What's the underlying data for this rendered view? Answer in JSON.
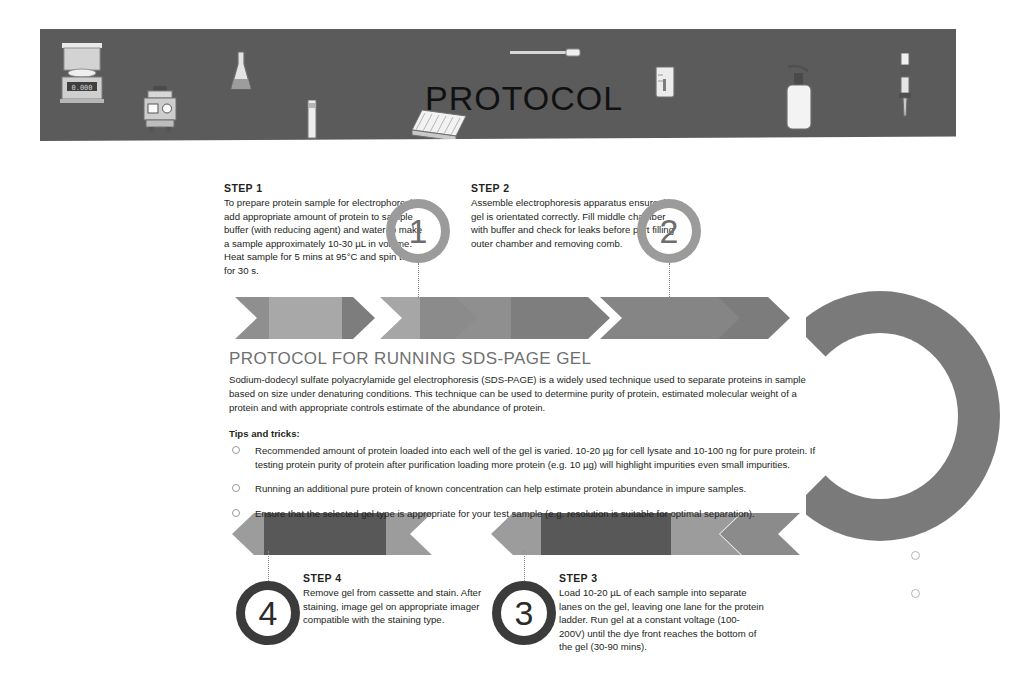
{
  "document": {
    "banner_title": "PROTOCOL",
    "banner_icons": [
      "analytical-balance-icon",
      "erlenmeyer-flask-icon",
      "vortex-mixer-icon",
      "cuvette-icon",
      "microplate-icon",
      "pipette-tip-icon",
      "beaker-icon",
      "wash-bottle-icon",
      "single-channel-pipette-icon",
      "multichannel-pipette-icon"
    ]
  },
  "main": {
    "title": "PROTOCOL FOR RUNNING SDS-PAGE GEL",
    "description": "Sodium-dodecyl sulfate polyacrylamide gel electrophoresis (SDS-PAGE) is a widely used technique used to separate proteins in sample based on size under denaturing conditions. This technique can be used to determine purity of protein, estimated molecular weight of a protein and with appropriate controls estimate of the abundance of protein.",
    "tips_title": "Tips and tricks:",
    "tips": [
      "Recommended amount of protein loaded into each well of the gel is varied. 10-20 µg for cell lysate and 10-100 ng for pure protein. If testing protein purity of protein after purification loading more protein (e.g. 10 µg) will highlight impurities even small impurities.",
      "Running an additional pure protein of known concentration can help estimate protein abundance in impure samples.",
      "Ensure that the selected gel type is appropriate for your test sample (e.g. resolution is suitable for optimal separation)."
    ]
  },
  "steps": [
    {
      "id": "step-1",
      "title": "STEP 1",
      "number": "1",
      "body": "To prepare protein sample for electrophoresis add appropriate amount of protein to sample buffer (with reducing agent) and water to make a sample approximately 10-30 µL in volume. Heat sample for 5 mins at 95°C and spin tube for 30 s."
    },
    {
      "id": "step-2",
      "title": "STEP 2",
      "number": "2",
      "body": "Assemble electrophoresis apparatus ensure the gel is orientated correctly. Fill middle chamber with buffer and check for leaks before part filling outer chamber and removing comb."
    },
    {
      "id": "step-3",
      "title": "STEP 3",
      "number": "3",
      "body": "Load 10-20 µL of each sample into separate lanes on the gel, leaving one lane for the protein ladder. Run gel at a constant voltage (100-200V) until the dye front reaches the bottom of the gel (30-90 mins)."
    },
    {
      "id": "step-4",
      "title": "STEP 4",
      "number": "4",
      "body": "Remove gel from cassette and stain. After staining, image gel on appropriate imager compatible with the staining type."
    }
  ],
  "colors": {
    "banner": "#5b5b5b",
    "arrow_light": "#9a9a9a",
    "arrow_mid": "#7a7a7a",
    "arrow_dark": "#555555",
    "badge_light_ring": "#9b9b9b",
    "badge_dark_ring": "#3b3b3b",
    "title_gray": "#6f6f6f",
    "text": "#231f20"
  }
}
